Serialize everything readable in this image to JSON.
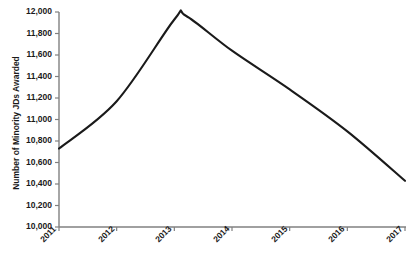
{
  "chart_data": {
    "type": "line",
    "title": "",
    "xlabel": "",
    "ylabel": "Number of Minority JDs Awarded",
    "x": [
      2011,
      2012,
      2013,
      2014,
      2015,
      2016,
      2017
    ],
    "categories": [
      "2011",
      "2012",
      "2013",
      "2014",
      "2015",
      "2016",
      "2017"
    ],
    "values": [
      10730,
      11170,
      11930,
      11640,
      11280,
      10890,
      10430
    ],
    "peak": {
      "x": 2013.2,
      "y": 11965
    },
    "series": [
      {
        "name": "Minority JDs Awarded",
        "color": "#1a1a1a",
        "values": [
          10730,
          11170,
          11930,
          11640,
          11280,
          10890,
          10430
        ]
      }
    ],
    "ylim": [
      10000,
      12000
    ],
    "xlim": [
      2011,
      2017
    ],
    "ytick_values": [
      10000,
      10200,
      10400,
      10600,
      10800,
      11000,
      11200,
      11400,
      11600,
      11800,
      12000
    ],
    "ytick_labels": [
      "10,000",
      "10,200",
      "10,400",
      "10,600",
      "10,800",
      "11,000",
      "11,200",
      "11,400",
      "11,600",
      "11,800",
      "12,000"
    ],
    "xtick_labels": [
      "2011",
      "2012",
      "2013",
      "2014",
      "2015",
      "2016",
      "2017"
    ],
    "grid": false,
    "legend": false,
    "legend_position": "none",
    "axis_color": "#808080",
    "line_color": "#1a1a1a",
    "background_color": "#ffffff",
    "xtick_label_rotation": -45
  }
}
